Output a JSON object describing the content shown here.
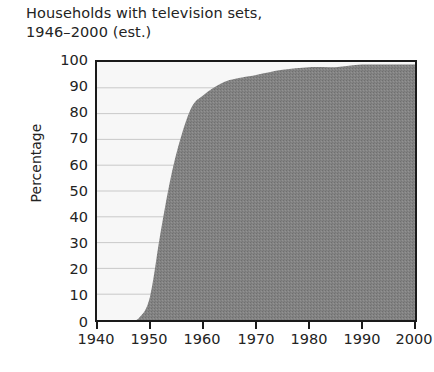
{
  "title": {
    "line1": "Households with television sets,",
    "line2": "1946–2000 (est.)"
  },
  "axes": {
    "ylabel": "Percentage",
    "xlabel": "",
    "y_ticks": [
      "100",
      "90",
      "80",
      "70",
      "60",
      "50",
      "40",
      "30",
      "20",
      "10",
      "0"
    ],
    "x_ticks": [
      "1940",
      "1950",
      "1960",
      "1970",
      "1980",
      "1990",
      "2000"
    ]
  },
  "colors": {
    "area_fill": "#808080",
    "plot_background": "#f7f7f7",
    "gridline": "#c9c9c9",
    "frame": "#1a1a1a",
    "text": "#232323"
  },
  "chart_data": {
    "type": "area",
    "title": "Households with television sets, 1946–2000 (est.)",
    "xlabel": "",
    "ylabel": "Percentage",
    "xlim": [
      1940,
      2000
    ],
    "ylim": [
      0,
      100
    ],
    "grid": true,
    "legend": null,
    "x": [
      1940,
      1946,
      1948,
      1950,
      1952,
      1954,
      1956,
      1958,
      1960,
      1962,
      1965,
      1970,
      1975,
      1980,
      1985,
      1990,
      1995,
      2000
    ],
    "values": [
      0,
      0,
      1,
      9,
      34,
      56,
      72,
      83,
      87,
      90,
      93,
      95,
      97,
      98,
      98,
      99,
      99,
      99
    ],
    "series": [
      {
        "name": "Households with television sets",
        "values": [
          0,
          0,
          1,
          9,
          34,
          56,
          72,
          83,
          87,
          90,
          93,
          95,
          97,
          98,
          98,
          99,
          99,
          99
        ]
      }
    ]
  }
}
